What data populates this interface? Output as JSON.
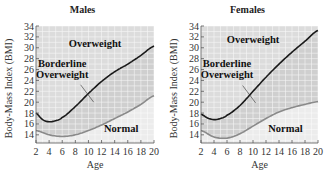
{
  "chart_data": [
    {
      "type": "line",
      "title": "Males",
      "xlabel": "Age",
      "ylabel": "Body-Mass Index (BMI)",
      "xlim": [
        2,
        20
      ],
      "ylim": [
        12.5,
        34
      ],
      "xticks": [
        2,
        4,
        6,
        8,
        10,
        12,
        14,
        16,
        18,
        20
      ],
      "yticks": [
        14,
        16,
        18,
        20,
        22,
        24,
        26,
        28,
        30,
        32,
        34
      ],
      "grid": true,
      "series": [
        {
          "name": "Overweight threshold",
          "color": "#1a1a1a",
          "x": [
            2,
            3,
            4,
            5,
            6,
            8,
            10,
            12,
            14,
            16,
            18,
            20
          ],
          "values": [
            18,
            16.8,
            16.4,
            16.6,
            17.2,
            19.2,
            21.6,
            23.8,
            25.6,
            27,
            28.6,
            30.3
          ]
        },
        {
          "name": "Normal threshold",
          "color": "#8a8a8a",
          "x": [
            2,
            4,
            6,
            8,
            10,
            12,
            14,
            16,
            18,
            20
          ],
          "values": [
            14.8,
            14,
            13.7,
            14,
            14.8,
            15.8,
            17,
            18.2,
            19.6,
            21.2
          ]
        }
      ],
      "annotations": [
        {
          "text": "Overweight",
          "x": 11,
          "y": 30.2
        },
        {
          "text": "Borderline",
          "x": 6,
          "y": 26.5
        },
        {
          "text": "Overweight",
          "x": 6,
          "y": 24.4
        },
        {
          "text": "Normal",
          "x": 15,
          "y": 14.6
        }
      ]
    },
    {
      "type": "line",
      "title": "Females",
      "xlabel": "Age",
      "ylabel": "Body-Mass Index (BMI)",
      "xlim": [
        2,
        20
      ],
      "ylim": [
        12.5,
        34
      ],
      "xticks": [
        2,
        4,
        6,
        8,
        10,
        12,
        14,
        16,
        18,
        20
      ],
      "yticks": [
        14,
        16,
        18,
        20,
        22,
        24,
        26,
        28,
        30,
        32,
        34
      ],
      "grid": true,
      "series": [
        {
          "name": "Overweight threshold",
          "color": "#1a1a1a",
          "x": [
            2,
            3,
            4,
            5,
            6,
            8,
            10,
            12,
            14,
            16,
            18,
            20
          ],
          "values": [
            17.8,
            17.1,
            16.8,
            17,
            17.6,
            19.4,
            22,
            24.6,
            27,
            29.2,
            31.2,
            33.2
          ]
        },
        {
          "name": "Normal threshold",
          "color": "#8a8a8a",
          "x": [
            2,
            4,
            6,
            8,
            10,
            12,
            14,
            16,
            18,
            20
          ],
          "values": [
            14.8,
            13.6,
            13.4,
            14.2,
            15.6,
            17,
            18.2,
            19,
            19.6,
            20.1
          ]
        }
      ],
      "annotations": [
        {
          "text": "Overweight",
          "x": 10,
          "y": 30.8
        },
        {
          "text": "Borderline",
          "x": 6,
          "y": 26.5
        },
        {
          "text": "Overweight",
          "x": 6,
          "y": 24.4
        },
        {
          "text": "Normal",
          "x": 15,
          "y": 14.6
        }
      ]
    }
  ],
  "panels": [
    {
      "title": "Males",
      "xlabel": "Age",
      "ylabel": "Body-Mass Index (BMI)",
      "labels": {
        "overweight": "Overweight",
        "borderline_1": "Borderline",
        "borderline_2": "Overweight",
        "normal": "Normal"
      }
    },
    {
      "title": "Females",
      "xlabel": "Age",
      "ylabel": "Body-Mass Index (BMI)",
      "labels": {
        "overweight": "Overweight",
        "borderline_1": "Borderline",
        "borderline_2": "Overweight",
        "normal": "Normal"
      }
    }
  ],
  "colors": {
    "upper_region": "#dcdcdc",
    "middle_region": "#cfcfcf",
    "lower_region": "#ececec",
    "upper_line": "#1a1a1a",
    "lower_line": "#8a8a8a",
    "grid": "#ffffff"
  }
}
